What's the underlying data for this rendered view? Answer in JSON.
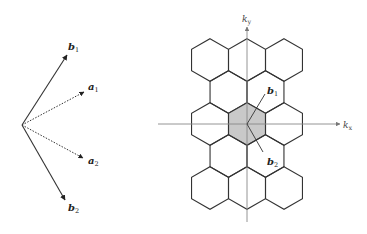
{
  "left_figure": {
    "title": "real-space and reciprocal lattice vectors",
    "origin": [
      22,
      125
    ],
    "vectors": [
      {
        "name": "b1",
        "label": "b",
        "sub": "1",
        "tip": [
          67,
          55
        ],
        "style": "solid",
        "label_pos": [
          68,
          50
        ]
      },
      {
        "name": "a1",
        "label": "a",
        "sub": "1",
        "tip": [
          84,
          92
        ],
        "style": "dotted",
        "label_pos": [
          88,
          90
        ]
      },
      {
        "name": "a2",
        "label": "a",
        "sub": "2",
        "tip": [
          83,
          158
        ],
        "style": "dotted",
        "label_pos": [
          88,
          164
        ]
      },
      {
        "name": "b2",
        "label": "b",
        "sub": "2",
        "tip": [
          65,
          200
        ],
        "style": "solid",
        "label_pos": [
          68,
          211
        ]
      }
    ]
  },
  "right_figure": {
    "title": "hexagonal Brillouin zones",
    "center": [
      247,
      124
    ],
    "hex_radius": 21.3,
    "shaded_fill": "#c9c9c9",
    "line_color": "#333333",
    "axis_color": "#888888",
    "axes": {
      "kx": {
        "label": "k",
        "sub": "x",
        "from": [
          158,
          124
        ],
        "to": [
          340,
          124
        ],
        "label_pos": [
          343,
          128
        ]
      },
      "ky": {
        "label": "k",
        "sub": "y",
        "from": [
          247,
          222
        ],
        "to": [
          247,
          27
        ],
        "label_pos": [
          242,
          22
        ]
      }
    },
    "rows": [
      {
        "cy": 60,
        "cx": [
          210,
          247,
          284
        ]
      },
      {
        "cy": 92,
        "cx": [
          228.5,
          265.5
        ]
      },
      {
        "cy": 124,
        "cx": [
          210,
          247,
          284
        ]
      },
      {
        "cy": 156,
        "cx": [
          228.5,
          265.5
        ]
      },
      {
        "cy": 188,
        "cx": [
          210,
          247,
          284
        ]
      }
    ],
    "vectors": [
      {
        "name": "b1",
        "label": "b",
        "sub": "1",
        "tip": [
          265,
          94
        ],
        "label_pos": [
          267,
          94
        ]
      },
      {
        "name": "b2",
        "label": "b",
        "sub": "2",
        "tip": [
          263,
          152
        ],
        "label_pos": [
          267,
          165
        ]
      }
    ]
  }
}
